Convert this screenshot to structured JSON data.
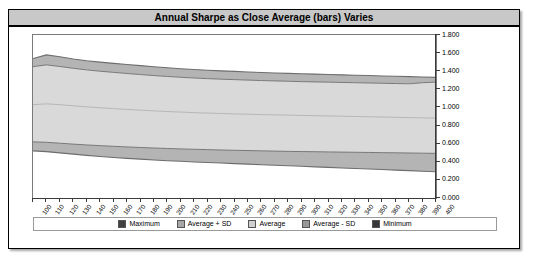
{
  "chart": {
    "title": "Annual Sharpe as Close Average (bars) Varies"
  },
  "legend": {
    "items": [
      {
        "label": "Maximum",
        "color": "#404040"
      },
      {
        "label": "Average + SD",
        "color": "#a8a8a8"
      },
      {
        "label": "Average",
        "color": "#d0d0d0"
      },
      {
        "label": "Average - SD",
        "color": "#989898"
      },
      {
        "label": "Minimum",
        "color": "#383838"
      }
    ]
  },
  "chart_data": {
    "type": "area",
    "title": "Annual Sharpe as Close Average (bars) Varies",
    "xlabel": "",
    "ylabel": "",
    "grid": false,
    "legend_position": "bottom",
    "xlim": [
      100,
      400
    ],
    "ylim": [
      0.0,
      1.8
    ],
    "ytick_labels": [
      "0.000",
      "0.200",
      "0.400",
      "0.600",
      "0.800",
      "1.000",
      "1.200",
      "1.400",
      "1.600",
      "1.800"
    ],
    "ytick_values": [
      0.0,
      0.2,
      0.4,
      0.6,
      0.8,
      1.0,
      1.2,
      1.4,
      1.6,
      1.8
    ],
    "categories": [
      100,
      110,
      120,
      130,
      140,
      150,
      160,
      170,
      180,
      190,
      200,
      210,
      220,
      230,
      240,
      250,
      260,
      270,
      280,
      290,
      300,
      310,
      320,
      330,
      340,
      350,
      360,
      370,
      380,
      390,
      400
    ],
    "series": [
      {
        "name": "Maximum",
        "color": "#404040",
        "values": [
          1.54,
          1.58,
          1.56,
          1.535,
          1.515,
          1.5,
          1.487,
          1.475,
          1.462,
          1.45,
          1.438,
          1.428,
          1.419,
          1.411,
          1.404,
          1.398,
          1.392,
          1.386,
          1.381,
          1.376,
          1.372,
          1.368,
          1.364,
          1.36,
          1.356,
          1.352,
          1.348,
          1.344,
          1.34,
          1.336,
          1.332
        ]
      },
      {
        "name": "Average + SD",
        "color": "#a8a8a8",
        "values": [
          1.45,
          1.47,
          1.452,
          1.432,
          1.415,
          1.4,
          1.387,
          1.375,
          1.363,
          1.352,
          1.342,
          1.333,
          1.325,
          1.318,
          1.312,
          1.307,
          1.302,
          1.297,
          1.293,
          1.289,
          1.285,
          1.282,
          1.279,
          1.276,
          1.273,
          1.27,
          1.267,
          1.264,
          1.261,
          1.273,
          1.28
        ]
      },
      {
        "name": "Average",
        "color": "#d0d0d0",
        "values": [
          1.03,
          1.04,
          1.03,
          1.018,
          1.006,
          0.996,
          0.987,
          0.978,
          0.97,
          0.962,
          0.955,
          0.949,
          0.943,
          0.938,
          0.933,
          0.929,
          0.925,
          0.921,
          0.918,
          0.915,
          0.912,
          0.909,
          0.906,
          0.903,
          0.9,
          0.897,
          0.894,
          0.891,
          0.888,
          0.885,
          0.882
        ]
      },
      {
        "name": "Average - SD",
        "color": "#989898",
        "values": [
          0.62,
          0.615,
          0.605,
          0.595,
          0.586,
          0.578,
          0.571,
          0.564,
          0.558,
          0.552,
          0.547,
          0.542,
          0.538,
          0.534,
          0.53,
          0.527,
          0.524,
          0.521,
          0.518,
          0.515,
          0.513,
          0.511,
          0.509,
          0.507,
          0.505,
          0.503,
          0.501,
          0.499,
          0.497,
          0.495,
          0.493
        ]
      },
      {
        "name": "Minimum",
        "color": "#383838",
        "values": [
          0.52,
          0.512,
          0.498,
          0.484,
          0.471,
          0.459,
          0.448,
          0.438,
          0.429,
          0.42,
          0.412,
          0.405,
          0.398,
          0.392,
          0.386,
          0.38,
          0.374,
          0.368,
          0.362,
          0.356,
          0.35,
          0.344,
          0.338,
          0.332,
          0.326,
          0.32,
          0.314,
          0.308,
          0.302,
          0.296,
          0.29
        ]
      }
    ],
    "band_fills": {
      "max_to_plus_sd": "#b4b4b4",
      "plus_sd_to_avg": "#d9d9d9",
      "avg_to_minus_sd": "#d9d9d9",
      "minus_sd_to_min": "#b4b4b4"
    }
  }
}
